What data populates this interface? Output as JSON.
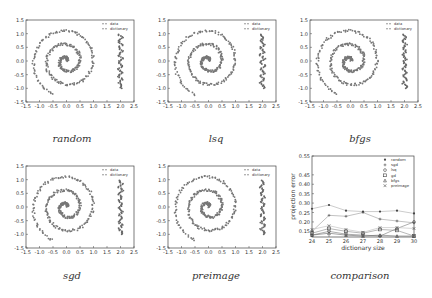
{
  "chart_data": [
    {
      "type": "scatter",
      "caption": "random",
      "legend": [
        "data",
        "dictionary"
      ],
      "legend_position": "top-right",
      "xlim": [
        -1.5,
        2.5
      ],
      "ylim": [
        -1.5,
        1.5
      ],
      "xticks": [
        "-1.5",
        "-1.0",
        "-0.5",
        "0.0",
        "0.5",
        "1.0",
        "1.5",
        "2.0",
        "2.5"
      ],
      "yticks": [
        "1.5",
        "1.0",
        "0.5",
        "0.0",
        "-0.5",
        "-1.0",
        "-1.5"
      ],
      "description": "noisy spiral (x from about -1.2 to 1.3) plus vertical noisy column near x=2.0 from y=-1.0 to 1.0"
    },
    {
      "type": "scatter",
      "caption": "lsq",
      "legend": [
        "data",
        "dictionary"
      ],
      "legend_position": "top-right",
      "xlim": [
        -1.5,
        2.5
      ],
      "ylim": [
        -1.5,
        1.5
      ],
      "xticks": [
        "-1.5",
        "-1.0",
        "-0.5",
        "0.0",
        "0.5",
        "1.0",
        "1.5",
        "2.0",
        "2.5"
      ],
      "yticks": [
        "1.5",
        "1.0",
        "0.5",
        "0.0",
        "-0.5",
        "-1.0",
        "-1.5"
      ]
    },
    {
      "type": "scatter",
      "caption": "bfgs",
      "legend": [
        "data",
        "dictionary"
      ],
      "legend_position": "top-right",
      "xlim": [
        -1.5,
        2.5
      ],
      "ylim": [
        -1.5,
        1.5
      ],
      "xticks": [
        "-1.5",
        "-1.0",
        "-0.5",
        "0.0",
        "0.5",
        "1.0",
        "1.5",
        "2.0",
        "2.5"
      ],
      "yticks": [
        "1.5",
        "1.0",
        "0.5",
        "0.0",
        "-0.5",
        "-1.0",
        "-1.5"
      ]
    },
    {
      "type": "scatter",
      "caption": "sgd",
      "legend": [
        "data",
        "dictionary"
      ],
      "legend_position": "top-right",
      "xlim": [
        -1.5,
        2.5
      ],
      "ylim": [
        -1.5,
        1.5
      ],
      "xticks": [
        "-1.5",
        "-1.0",
        "-0.5",
        "0.0",
        "0.5",
        "1.0",
        "1.5",
        "2.0",
        "2.5"
      ],
      "yticks": [
        "1.5",
        "1.0",
        "0.5",
        "0.0",
        "-0.5",
        "-1.0",
        "-1.5"
      ]
    },
    {
      "type": "scatter",
      "caption": "preimage",
      "legend": [
        "data",
        "dictionary"
      ],
      "legend_position": "top-right",
      "xlim": [
        -1.5,
        2.5
      ],
      "ylim": [
        -1.5,
        1.5
      ],
      "xticks": [
        "-1.5",
        "-1.0",
        "-0.5",
        "0.0",
        "0.5",
        "1.0",
        "1.5",
        "2.0",
        "2.5"
      ],
      "yticks": [
        "1.5",
        "1.0",
        "0.5",
        "0.0",
        "-0.5",
        "-1.0",
        "-1.5"
      ]
    },
    {
      "type": "line",
      "caption": "comparison",
      "xlabel": "dictionary size",
      "ylabel": "projection error",
      "xlim": [
        24,
        30
      ],
      "ylim": [
        0.12,
        0.55
      ],
      "xticks": [
        "24",
        "25",
        "26",
        "27",
        "28",
        "29",
        "30"
      ],
      "yticks": [
        "0.55",
        "0.45",
        "0.40",
        "0.35",
        "0.30",
        "0.25",
        "0.20",
        "0.15"
      ],
      "legend_position": "top-right",
      "x": [
        24,
        25,
        26,
        27,
        28,
        29,
        30
      ],
      "series": [
        {
          "name": "random",
          "marker": "*",
          "values": [
            0.27,
            0.29,
            0.26,
            0.255,
            0.255,
            0.26,
            0.245
          ]
        },
        {
          "name": "sgd",
          "marker": "+",
          "values": [
            0.15,
            0.235,
            0.23,
            0.25,
            0.215,
            0.205,
            0.195
          ]
        },
        {
          "name": "lsq",
          "marker": "o",
          "values": [
            0.13,
            0.15,
            0.135,
            0.13,
            0.125,
            0.165,
            0.2
          ]
        },
        {
          "name": "gd",
          "marker": "s",
          "values": [
            0.14,
            0.165,
            0.15,
            0.14,
            0.16,
            0.155,
            0.125
          ]
        },
        {
          "name": "bfgs",
          "marker": "^",
          "values": [
            0.13,
            0.14,
            0.13,
            0.125,
            0.13,
            0.125,
            0.125
          ]
        },
        {
          "name": "preimage",
          "marker": "x",
          "values": [
            0.16,
            0.18,
            0.16,
            0.145,
            0.17,
            0.17,
            0.165
          ]
        }
      ]
    }
  ]
}
